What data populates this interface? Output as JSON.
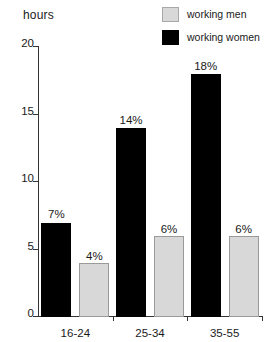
{
  "axis_title": "hours",
  "legend": {
    "position": "top-right",
    "entries": [
      {
        "label": "working men",
        "swatch": "light-gray-square",
        "color": "#d8d8d8"
      },
      {
        "label": "working women",
        "swatch": "black-square",
        "color": "#000000"
      }
    ]
  },
  "chart_data": {
    "type": "bar",
    "title": "",
    "subtitle": "",
    "xlabel": "",
    "ylabel": "hours",
    "categories": [
      "16-24",
      "25-34",
      "35-55"
    ],
    "series": [
      {
        "name": "working women",
        "color": "#000000",
        "values": [
          7,
          14,
          18
        ],
        "data_labels": [
          "7%",
          "14%",
          "18%"
        ]
      },
      {
        "name": "working men",
        "color": "#d8d8d8",
        "values": [
          4,
          6,
          6
        ],
        "data_labels": [
          "4%",
          "6%",
          "6%"
        ]
      }
    ],
    "ylim": [
      0,
      20
    ],
    "yticks": [
      0,
      5,
      10,
      15,
      20
    ],
    "ytick_labels": [
      "0",
      "5",
      "10",
      "15",
      "20"
    ],
    "grid": false,
    "legend_position": "top-right"
  }
}
